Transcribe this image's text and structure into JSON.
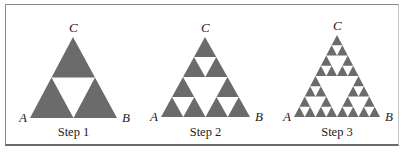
{
  "figure": {
    "fill_color": "#6b6b6b",
    "panels": [
      {
        "step_label": "Step 1",
        "depth": 1,
        "vertices": {
          "A": "A",
          "B": "B",
          "C": "C"
        },
        "apex": [
          73,
          37
        ],
        "left": [
          30,
          118
        ],
        "right": [
          117,
          118
        ]
      },
      {
        "step_label": "Step 2",
        "depth": 2,
        "vertices": {
          "A": "A",
          "B": "B",
          "C": "C"
        },
        "apex": [
          205,
          37
        ],
        "left": [
          161,
          117
        ],
        "right": [
          250,
          117
        ]
      },
      {
        "step_label": "Step 3",
        "depth": 3,
        "vertices": {
          "A": "A",
          "B": "B",
          "C": "C"
        },
        "apex": [
          337,
          35
        ],
        "left": [
          294,
          117
        ],
        "right": [
          380,
          117
        ]
      }
    ]
  }
}
